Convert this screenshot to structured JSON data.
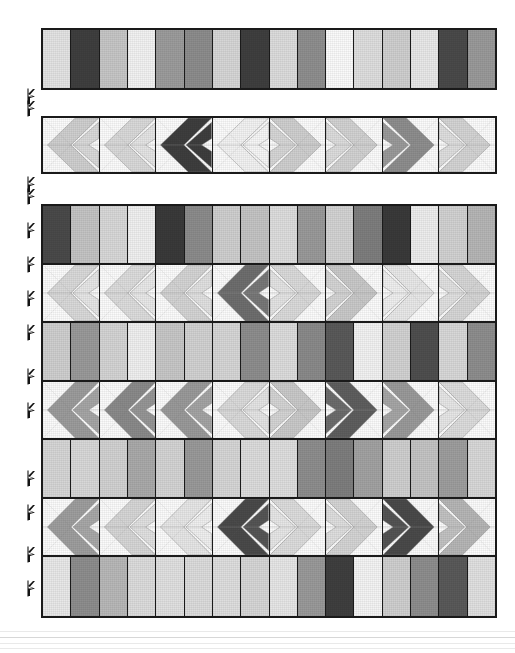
{
  "page": {
    "background_color": "#ffffff",
    "outline_color": "#1a1a1a"
  },
  "palette": {
    "near_white": "#fbfbfb",
    "pale": "#ededed",
    "light": "#dcdcdc",
    "light_mid": "#c9c9c9",
    "mid": "#b0b0b0",
    "mid_dark": "#949494",
    "dark": "#6e6e6e",
    "very_dark": "#4a4a4a",
    "black_ish": "#3a3a3a"
  },
  "markers": {
    "icon": "arrow-marker-icon",
    "count": 12,
    "positions_y": [
      88,
      100,
      176,
      188,
      222,
      256,
      290,
      324,
      368,
      402,
      470,
      504,
      546,
      580
    ],
    "x": 24
  },
  "strips": [
    {
      "name": "top-bar-strip",
      "type": "bars",
      "cell_count": 16,
      "colors": [
        "#e3e3e3",
        "#3f3f3f",
        "#c6c6c6",
        "#f2f2f2",
        "#9c9c9c",
        "#8d8d8d",
        "#d6d6d6",
        "#3f3f3f",
        "#dcdcdc",
        "#8f8f8f",
        "#fafafa",
        "#dedede",
        "#cfcfcf",
        "#e8e8e8",
        "#4a4a4a",
        "#9a9a9a"
      ]
    },
    {
      "name": "second-chevron-strip",
      "type": "chevrons",
      "block_count": 8,
      "blocks": [
        {
          "direction": "left",
          "outer": "#cfcfcf",
          "inner": "#d9d9d9"
        },
        {
          "direction": "left",
          "outer": "#d9d9d9",
          "inner": "#e4e4e4"
        },
        {
          "direction": "left",
          "outer": "#3e3e3e",
          "inner": "#3e3e3e"
        },
        {
          "direction": "left",
          "outer": "#f2f2f2",
          "inner": "#f6f6f6"
        },
        {
          "direction": "right",
          "outer": "#cfcfcf",
          "inner": "#d6d6d6"
        },
        {
          "direction": "right",
          "outer": "#d2d2d2",
          "inner": "#dcdcdc"
        },
        {
          "direction": "right",
          "outer": "#8e8e8e",
          "inner": "#9a9a9a"
        },
        {
          "direction": "right",
          "outer": "#d4d4d4",
          "inner": "#dedede"
        }
      ]
    }
  ],
  "main_block": {
    "name": "main-pattern-block",
    "row_count": 7,
    "rows": [
      {
        "index": 0,
        "type": "bars",
        "cell_count": 16,
        "colors": [
          "#4a4a4a",
          "#c4c4c4",
          "#d8d8d8",
          "#f0f0f0",
          "#3a3a3a",
          "#8c8c8c",
          "#cfcfcf",
          "#c4c4c4",
          "#dddddd",
          "#9a9a9a",
          "#d3d3d3",
          "#7e7e7e",
          "#3a3a3a",
          "#ededed",
          "#d2d2d2",
          "#b6b6b6"
        ]
      },
      {
        "index": 1,
        "type": "chevrons",
        "block_count": 8,
        "blocks": [
          {
            "direction": "left",
            "outer": "#d9d9d9",
            "inner": "#e6e6e6"
          },
          {
            "direction": "left",
            "outer": "#dcdcdc",
            "inner": "#e8e8e8"
          },
          {
            "direction": "left",
            "outer": "#d4d4d4",
            "inner": "#e0e0e0"
          },
          {
            "direction": "left",
            "outer": "#6e6e6e",
            "inner": "#787878"
          },
          {
            "direction": "right",
            "outer": "#dadada",
            "inner": "#e3e3e3"
          },
          {
            "direction": "right",
            "outer": "#c9c9c9",
            "inner": "#d4d4d4"
          },
          {
            "direction": "right",
            "outer": "#e8e8e8",
            "inner": "#efefef"
          },
          {
            "direction": "right",
            "outer": "#d6d6d6",
            "inner": "#e0e0e0"
          }
        ]
      },
      {
        "index": 2,
        "type": "bars",
        "cell_count": 16,
        "colors": [
          "#cfcfcf",
          "#9a9a9a",
          "#d4d4d4",
          "#efefef",
          "#c7c7c7",
          "#d2d2d2",
          "#d6d6d6",
          "#8e8e8e",
          "#dcdcdc",
          "#8a8a8a",
          "#5a5a5a",
          "#f2f2f2",
          "#d2d2d2",
          "#4f4f4f",
          "#d8d8d8",
          "#8e8e8e"
        ]
      },
      {
        "index": 3,
        "type": "chevrons",
        "block_count": 8,
        "blocks": [
          {
            "direction": "left",
            "outer": "#9c9c9c",
            "inner": "#a6a6a6"
          },
          {
            "direction": "left",
            "outer": "#8a8a8a",
            "inner": "#969696"
          },
          {
            "direction": "left",
            "outer": "#9a9a9a",
            "inner": "#a4a4a4"
          },
          {
            "direction": "left",
            "outer": "#dadada",
            "inner": "#e4e4e4"
          },
          {
            "direction": "right",
            "outer": "#c9c9c9",
            "inner": "#d4d4d4"
          },
          {
            "direction": "right",
            "outer": "#5f5f5f",
            "inner": "#6c6c6c"
          },
          {
            "direction": "right",
            "outer": "#9a9a9a",
            "inner": "#a6a6a6"
          },
          {
            "direction": "right",
            "outer": "#dcdcdc",
            "inner": "#e6e6e6"
          }
        ]
      },
      {
        "index": 4,
        "type": "bars",
        "cell_count": 16,
        "colors": [
          "#d6d6d6",
          "#d8d8d8",
          "#d2d2d2",
          "#aaaaaa",
          "#d4d4d4",
          "#9a9a9a",
          "#d6d6d6",
          "#dcdcdc",
          "#dedede",
          "#8e8e8e",
          "#7e7e7e",
          "#a2a2a2",
          "#cfcfcf",
          "#c4c4c4",
          "#9e9e9e",
          "#d8d8d8"
        ]
      },
      {
        "index": 5,
        "type": "chevrons",
        "block_count": 8,
        "blocks": [
          {
            "direction": "left",
            "outer": "#9e9e9e",
            "inner": "#a8a8a8"
          },
          {
            "direction": "left",
            "outer": "#d6d6d6",
            "inner": "#e0e0e0"
          },
          {
            "direction": "left",
            "outer": "#e6e6e6",
            "inner": "#efefef"
          },
          {
            "direction": "left",
            "outer": "#4a4a4a",
            "inner": "#555555"
          },
          {
            "direction": "right",
            "outer": "#dcdcdc",
            "inner": "#e6e6e6"
          },
          {
            "direction": "right",
            "outer": "#d4d4d4",
            "inner": "#dedede"
          },
          {
            "direction": "right",
            "outer": "#4a4a4a",
            "inner": "#545454"
          },
          {
            "direction": "right",
            "outer": "#b6b6b6",
            "inner": "#c2c2c2"
          }
        ]
      },
      {
        "index": 6,
        "type": "bars",
        "cell_count": 16,
        "colors": [
          "#e8e8e8",
          "#8e8e8e",
          "#b8b8b8",
          "#dcdcdc",
          "#e0e0e0",
          "#dcdcdc",
          "#dedede",
          "#d6d6d6",
          "#e6e6e6",
          "#9a9a9a",
          "#3f3f3f",
          "#f4f4f4",
          "#cfcfcf",
          "#8e8e8e",
          "#5a5a5a",
          "#e0e0e0"
        ]
      }
    ]
  }
}
